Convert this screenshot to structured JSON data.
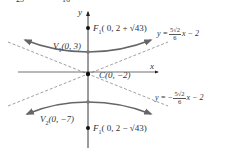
{
  "figure": {
    "top_fragment": [
      "25",
      "16"
    ],
    "axes": {
      "x_label": "x",
      "y_label": "y"
    },
    "points": {
      "focus_top": {
        "name": "F",
        "sub": "1",
        "coords": "( 0, 2 + √43)"
      },
      "vertex_top": {
        "name": "V",
        "sub": "1",
        "coords": "(0, 3)"
      },
      "center": {
        "name": "C",
        "coords": "(0, −2)"
      },
      "vertex_bottom": {
        "name": "V",
        "sub": "2",
        "coords": "(0, −7)"
      },
      "focus_bottom": {
        "name": "F",
        "sub": "1",
        "coords": "( 0, 2 − √43)"
      }
    },
    "asymptotes": {
      "upper": {
        "lhs": "y =",
        "num": "5√2",
        "den": "6",
        "rhs": "x − 2",
        "sign": ""
      },
      "lower": {
        "lhs": "y =",
        "num": "5√2",
        "den": "6",
        "rhs": "x − 2",
        "sign": "−"
      }
    },
    "colors": {
      "curve": "#6b6b6b",
      "axis": "#222222",
      "dashed": "#777777",
      "point": "#111111"
    }
  }
}
